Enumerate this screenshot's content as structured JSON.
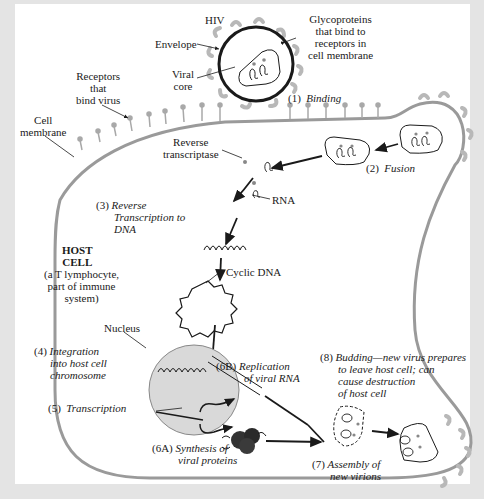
{
  "diagram": {
    "colors": {
      "background_border": "#e4e4e4",
      "panel": "#ffffff",
      "membrane": "#9a9a9a",
      "glycoprotein": "#b8b8b8",
      "nucleus_fill": "#d9d9d9",
      "ink": "#1a1a1a"
    },
    "labels": {
      "hiv": "HIV",
      "envelope": "Envelope",
      "viral_core": [
        "Viral",
        "core"
      ],
      "glycoproteins": [
        "Glycoproteins",
        "that bind to",
        "receptors in",
        "cell membrane"
      ],
      "receptors": [
        "Receptors",
        "that",
        "bind virus"
      ],
      "cell_membrane": [
        "Cell",
        "membrane"
      ],
      "reverse_transcriptase": [
        "Reverse",
        "transcriptase"
      ],
      "rna": "RNA",
      "host_cell_title": [
        "HOST",
        "CELL"
      ],
      "host_cell_desc": [
        "(a T lymphocyte,",
        "part of immune",
        "system)"
      ],
      "cyclic_dna": "Cyclic DNA",
      "nucleus": "Nucleus"
    },
    "steps": [
      {
        "num": "(1)",
        "lines": [
          "Binding"
        ]
      },
      {
        "num": "(2)",
        "lines": [
          "Fusion"
        ]
      },
      {
        "num": "(3)",
        "lines": [
          "Reverse",
          "Transcription to",
          "DNA"
        ]
      },
      {
        "num": "(4)",
        "lines": [
          "Integration",
          "into host cell",
          "chromosome"
        ]
      },
      {
        "num": "(5)",
        "lines": [
          "Transcription"
        ]
      },
      {
        "num": "(6A)",
        "lines": [
          "Synthesis of",
          "viral proteins"
        ]
      },
      {
        "num": "(6B)",
        "lines": [
          "Replication",
          "of viral RNA"
        ]
      },
      {
        "num": "(7)",
        "lines": [
          "Assembly of",
          "new virions"
        ]
      },
      {
        "num": "(8)",
        "lines": [
          "Budding—new virus prepares",
          "to leave host cell; can",
          "cause destruction",
          "of host cell"
        ]
      }
    ]
  }
}
